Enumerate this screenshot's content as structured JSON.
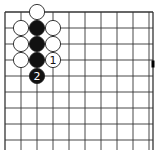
{
  "board": {
    "line_color": "#333333",
    "origin_x": 5,
    "origin_y": 12,
    "spacing": 16,
    "cols": 10,
    "rows": 10,
    "right_edge_x": 153,
    "edges": {
      "top": true,
      "left": true,
      "right": true,
      "bottom": false
    }
  },
  "stones": [
    {
      "color": "white",
      "col": 2,
      "row": 0,
      "label": ""
    },
    {
      "color": "white",
      "col": 1,
      "row": 1,
      "label": ""
    },
    {
      "color": "black",
      "col": 2,
      "row": 1,
      "label": ""
    },
    {
      "color": "white",
      "col": 3,
      "row": 1,
      "label": ""
    },
    {
      "color": "white",
      "col": 1,
      "row": 2,
      "label": ""
    },
    {
      "color": "black",
      "col": 2,
      "row": 2,
      "label": ""
    },
    {
      "color": "white",
      "col": 3,
      "row": 2,
      "label": ""
    },
    {
      "color": "white",
      "col": 1,
      "row": 3,
      "label": ""
    },
    {
      "color": "black",
      "col": 2,
      "row": 3,
      "label": ""
    },
    {
      "color": "white",
      "col": 3,
      "row": 3,
      "label": "1"
    },
    {
      "color": "black",
      "col": 2,
      "row": 4,
      "label": "2"
    }
  ],
  "edge_marker": {
    "x": 153,
    "y": 64,
    "color": "#000000"
  },
  "caption": ""
}
